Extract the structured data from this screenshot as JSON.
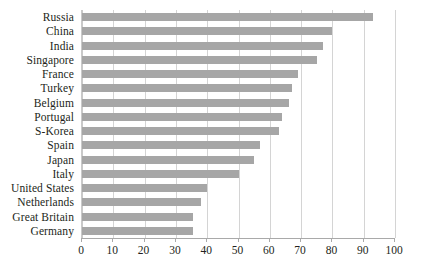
{
  "chart_data": {
    "type": "bar",
    "orientation": "horizontal",
    "title": "",
    "subtitle": "",
    "xlabel": "",
    "ylabel": "",
    "xlim": [
      0,
      100
    ],
    "ylim": null,
    "xticks": [
      0,
      10,
      20,
      30,
      40,
      50,
      60,
      70,
      80,
      90,
      100
    ],
    "xtick_labels": [
      "0",
      "10",
      "20",
      "30",
      "40",
      "50",
      "60",
      "70",
      "80",
      "90",
      "100"
    ],
    "grid": "vertical",
    "legend": null,
    "legend_position": "none",
    "bar_color": "#a6a6a6",
    "gridline_color": "#d4d4d4",
    "axis_color": "#a9a9a9",
    "text_color": "#231f20",
    "categories": [
      "Russia",
      "China",
      "India",
      "Singapore",
      "France",
      "Turkey",
      "Belgium",
      "Portugal",
      "S-Korea",
      "Spain",
      "Japan",
      "Italy",
      "United States",
      "Netherlands",
      "Great Britain",
      "Germany"
    ],
    "values": [
      93,
      80,
      77,
      75,
      69,
      67,
      66,
      64,
      63,
      57,
      55,
      50,
      40,
      38,
      35.5,
      35.5
    ]
  }
}
